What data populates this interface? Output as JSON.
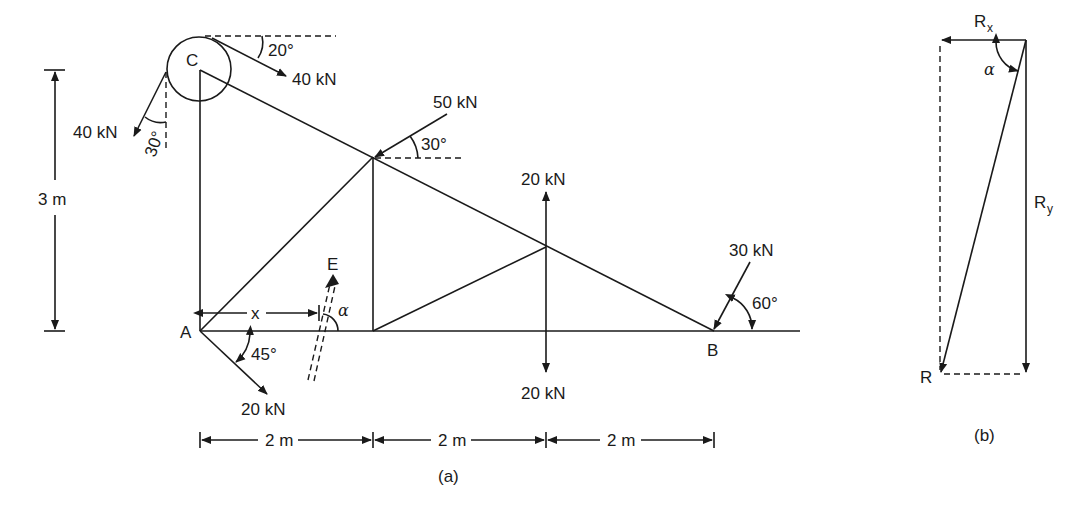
{
  "figure_a": {
    "caption": "(a)",
    "points": {
      "A": "A",
      "B": "B",
      "C": "C",
      "E": "E"
    },
    "forces": {
      "c_top": {
        "label": "40 kN",
        "angle": "20°"
      },
      "c_left": {
        "label": "40 kN",
        "angle": "30°"
      },
      "joint_top": {
        "label": "50 kN",
        "angle": "30°"
      },
      "mid_up": {
        "label": "20 kN"
      },
      "mid_down": {
        "label": "20 kN"
      },
      "at_b": {
        "label": "30 kN",
        "angle": "60°"
      },
      "at_a": {
        "label": "20 kN",
        "angle": "45°"
      }
    },
    "resultant_line": {
      "distance_label": "x",
      "angle_label": "α"
    },
    "dimensions": {
      "height": "3 m",
      "spans": [
        "2 m",
        "2 m",
        "2 m"
      ]
    }
  },
  "figure_b": {
    "caption": "(b)",
    "rx": {
      "main": "R",
      "sub": "x"
    },
    "ry": {
      "main": "R",
      "sub": "y"
    },
    "r": "R",
    "angle": "α"
  }
}
